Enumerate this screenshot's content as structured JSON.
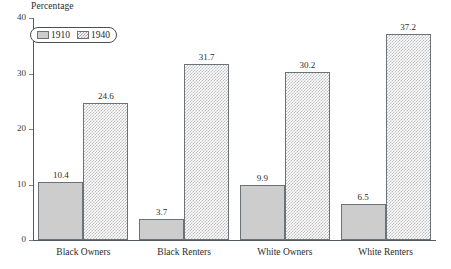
{
  "chart_data": {
    "type": "bar",
    "title": "",
    "ylabel": "Percentage",
    "xlabel": "",
    "ylim": [
      0,
      40
    ],
    "yticks": [
      0,
      10,
      20,
      30,
      40
    ],
    "ytick_labels": [
      "0",
      "10",
      "20",
      "30",
      "40"
    ],
    "grid": false,
    "legend_position": "top-left",
    "categories": [
      "Black Owners",
      "Black Renters",
      "White Owners",
      "White Renters"
    ],
    "series": [
      {
        "name": "1910",
        "values": [
          10.4,
          3.7,
          9.9,
          6.5
        ],
        "value_labels": [
          "10.4",
          "3.7",
          "9.9",
          "6.5"
        ],
        "fill": "solid-gray",
        "color": "#cdcdcd"
      },
      {
        "name": "1940",
        "values": [
          24.6,
          31.7,
          30.2,
          37.2
        ],
        "value_labels": [
          "24.6",
          "31.7",
          "30.2",
          "37.2"
        ],
        "fill": "checkerboard-hatch",
        "color": "#bfbfbf"
      }
    ]
  },
  "axis": {
    "line_color": "#555a5e"
  }
}
